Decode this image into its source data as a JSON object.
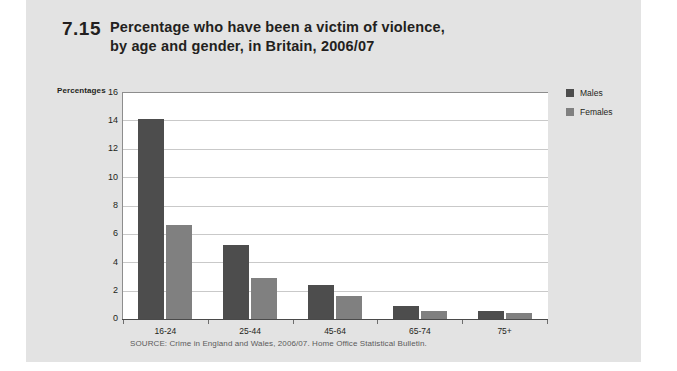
{
  "figure": {
    "number": "7.15",
    "title_line1": "Percentage who have been a victim of violence,",
    "title_line2": "by age and gender, in Britain, 2006/07",
    "source": "SOURCE: Crime in England and Wales, 2006/07. Home Office Statistical Bulletin."
  },
  "axis": {
    "y_axis_caption": "Percentages",
    "y_ticks": [
      "0",
      "2",
      "4",
      "6",
      "8",
      "10",
      "12",
      "14",
      "16"
    ]
  },
  "legend": {
    "items": [
      {
        "label": "Males",
        "color": "#4d4d4d"
      },
      {
        "label": "Females",
        "color": "#808080"
      }
    ]
  },
  "chart_data": {
    "type": "bar",
    "subtitle": "",
    "xlabel": "",
    "ylabel": "Percentages",
    "ylim": [
      0,
      16
    ],
    "ytick_step": 2,
    "grid": true,
    "legend_position": "right",
    "categories": [
      "16-24",
      "25-44",
      "45-64",
      "65-74",
      "75+"
    ],
    "series": [
      {
        "name": "Males",
        "color": "#4d4d4d",
        "values": [
          14.1,
          5.2,
          2.4,
          0.9,
          0.6
        ]
      },
      {
        "name": "Females",
        "color": "#808080",
        "values": [
          6.6,
          2.9,
          1.6,
          0.6,
          0.4
        ]
      }
    ],
    "source": "SOURCE: Crime in England and Wales, 2006/07. Home Office Statistical Bulletin."
  }
}
